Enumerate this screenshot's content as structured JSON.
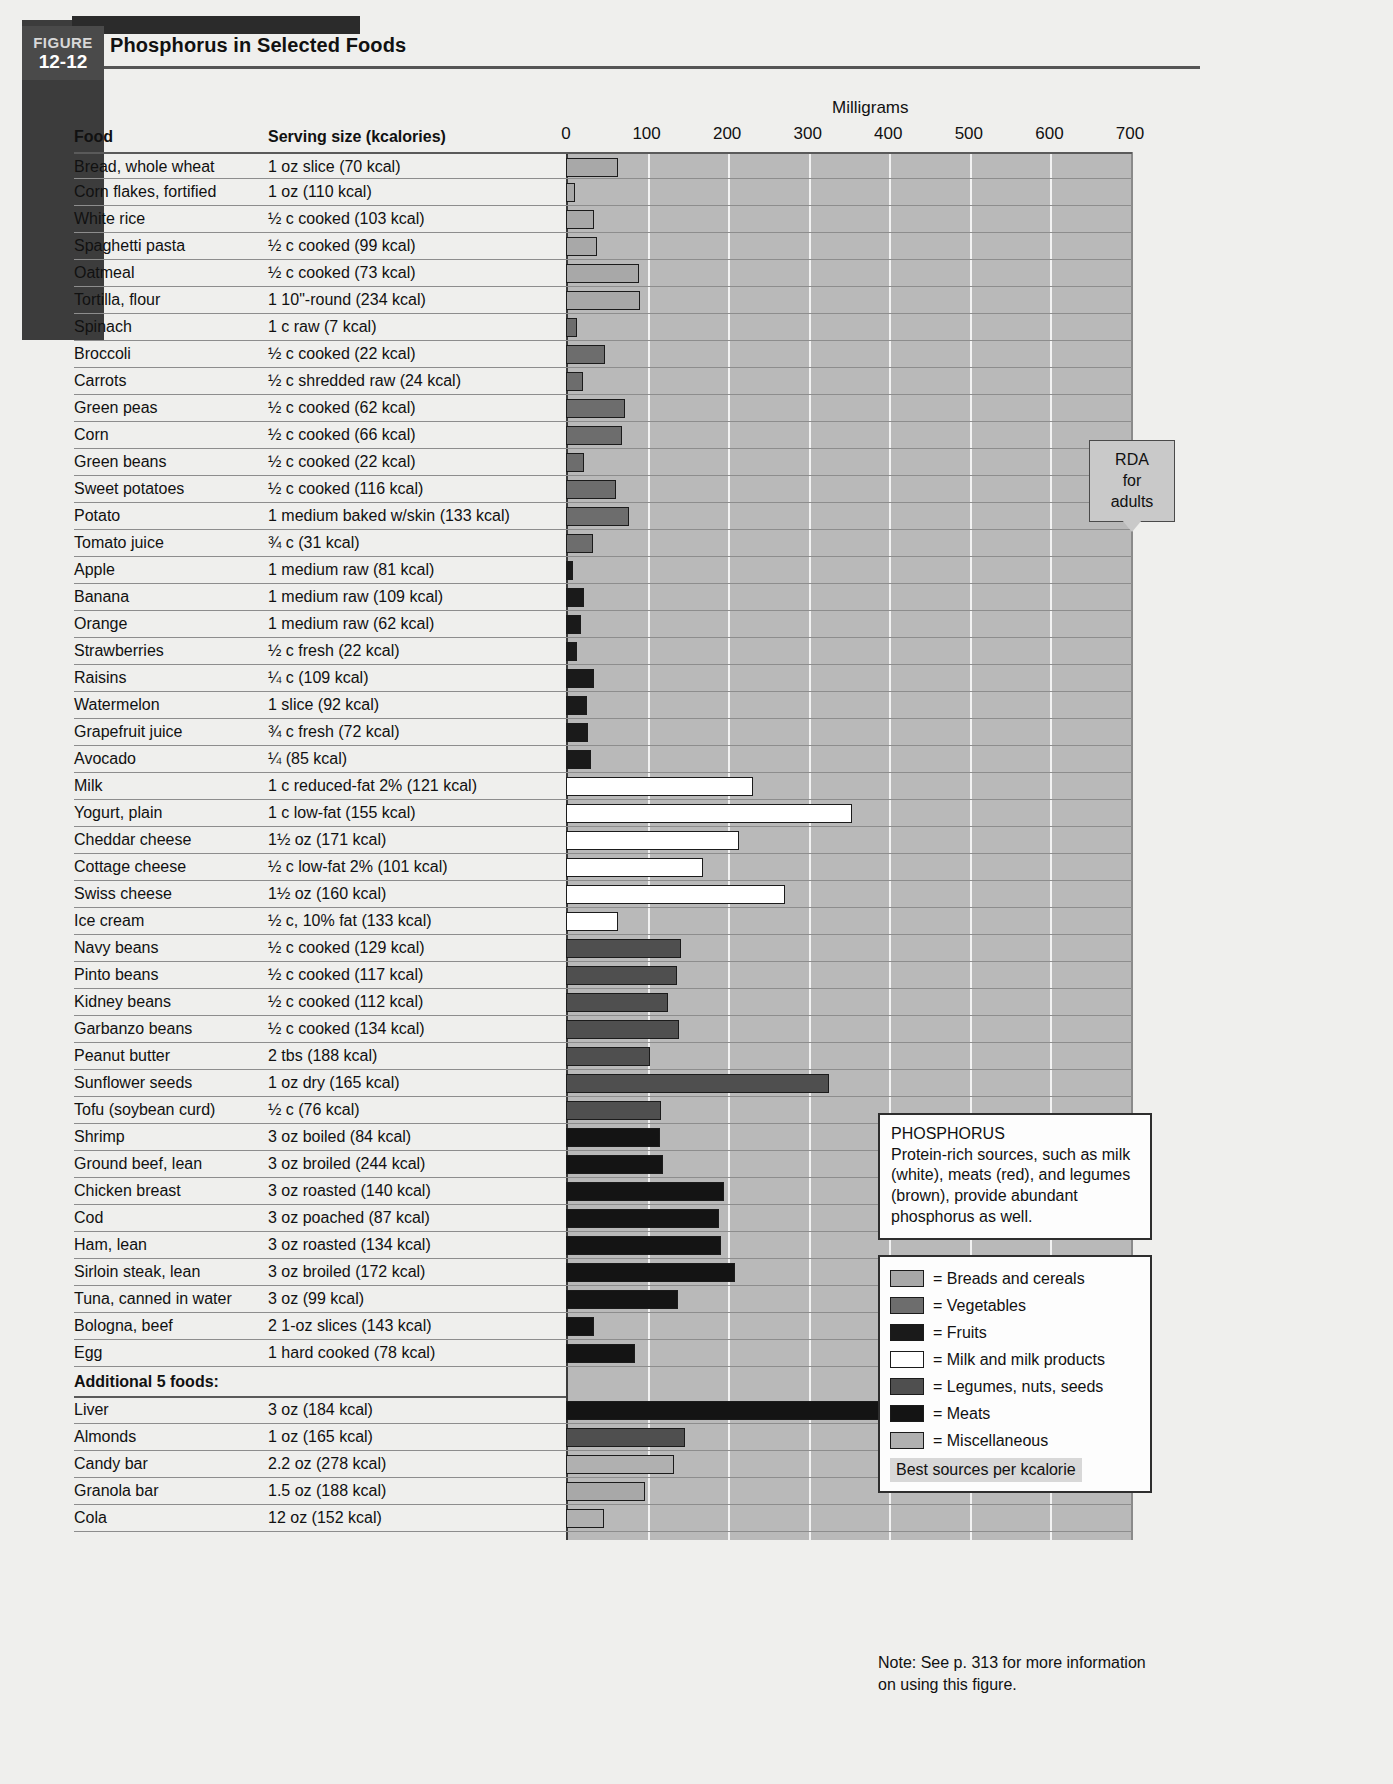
{
  "figure": {
    "tab_word": "FIGURE",
    "tab_number": "12-12",
    "title": "Phosphorus in Selected Foods"
  },
  "table_headers": {
    "food": "Food",
    "serving": "Serving size (kcalories)"
  },
  "rda_callout": {
    "line1": "RDA",
    "line2": "for",
    "line3": "adults",
    "value": 700
  },
  "info_callout": {
    "title": "PHOSPHORUS",
    "body": "Protein-rich sources, such as milk (white), meats (red), and legumes (brown), provide abundant phosphorus as well."
  },
  "legend": {
    "items": [
      {
        "label": "= Breads and cereals",
        "color": "#a8a8a8",
        "key": "breads"
      },
      {
        "label": "= Vegetables",
        "color": "#6d6d6d",
        "key": "vegetables"
      },
      {
        "label": "= Fruits",
        "color": "#1a1a1a",
        "key": "fruits"
      },
      {
        "label": "= Milk and milk products",
        "color": "#ffffff",
        "key": "milk"
      },
      {
        "label": "= Legumes, nuts, seeds",
        "color": "#4f4f4f",
        "key": "legumes"
      },
      {
        "label": "= Meats",
        "color": "#141414",
        "key": "meats"
      },
      {
        "label": "= Miscellaneous",
        "color": "#b0b0b0",
        "key": "misc"
      }
    ],
    "footer": "Best sources per kcalorie"
  },
  "note": "Note: See p. 313 for more information on using this figure.",
  "section_heading": "Additional 5 foods:",
  "chart_data": {
    "type": "bar",
    "title": "Phosphorus in Selected Foods",
    "xlabel": "Milligrams",
    "ylabel": "",
    "xlim": [
      0,
      700
    ],
    "xticks": [
      0,
      100,
      200,
      300,
      400,
      500,
      600,
      700
    ],
    "grid": true,
    "legend_position": "right",
    "reference_line": {
      "label": "RDA for adults",
      "value": 700
    },
    "units": "mg",
    "categories": [
      "Bread, whole wheat",
      "Corn flakes, fortified",
      "White rice",
      "Spaghetti pasta",
      "Oatmeal",
      "Tortilla, flour",
      "Spinach",
      "Broccoli",
      "Carrots",
      "Green peas",
      "Corn",
      "Green beans",
      "Sweet potatoes",
      "Potato",
      "Tomato juice",
      "Apple",
      "Banana",
      "Orange",
      "Strawberries",
      "Raisins",
      "Watermelon",
      "Grapefruit juice",
      "Avocado",
      "Milk",
      "Yogurt, plain",
      "Cheddar cheese",
      "Cottage cheese",
      "Swiss cheese",
      "Ice cream",
      "Navy beans",
      "Pinto beans",
      "Kidney beans",
      "Garbanzo beans",
      "Peanut butter",
      "Sunflower seeds",
      "Tofu (soybean curd)",
      "Shrimp",
      "Ground beef, lean",
      "Chicken breast",
      "Cod",
      "Ham, lean",
      "Sirloin steak, lean",
      "Tuna, canned in water",
      "Bologna, beef",
      "Egg",
      "Liver",
      "Almonds",
      "Candy bar",
      "Granola bar",
      "Cola"
    ],
    "values": [
      65,
      11,
      35,
      38,
      90,
      92,
      14,
      48,
      21,
      73,
      70,
      22,
      62,
      78,
      34,
      9,
      22,
      18,
      14,
      35,
      26,
      27,
      31,
      232,
      355,
      215,
      170,
      272,
      65,
      143,
      138,
      127,
      140,
      104,
      326,
      118,
      117,
      120,
      196,
      190,
      192,
      210,
      139,
      35,
      86,
      523,
      148,
      134,
      98,
      47
    ],
    "rows": [
      {
        "food": "Bread, whole wheat",
        "serving": "1 oz slice (70 kcal)",
        "value": 65,
        "group": "breads"
      },
      {
        "food": "Corn flakes, fortified",
        "serving": "1 oz (110 kcal)",
        "value": 11,
        "group": "breads"
      },
      {
        "food": "White rice",
        "serving": "½ c cooked (103 kcal)",
        "value": 35,
        "group": "breads"
      },
      {
        "food": "Spaghetti pasta",
        "serving": "½ c cooked (99 kcal)",
        "value": 38,
        "group": "breads"
      },
      {
        "food": "Oatmeal",
        "serving": "½ c cooked (73 kcal)",
        "value": 90,
        "group": "breads"
      },
      {
        "food": "Tortilla, flour",
        "serving": "1 10\"-round (234 kcal)",
        "value": 92,
        "group": "breads"
      },
      {
        "food": "Spinach",
        "serving": "1 c raw (7 kcal)",
        "value": 14,
        "group": "vegetables"
      },
      {
        "food": "Broccoli",
        "serving": "½ c cooked (22 kcal)",
        "value": 48,
        "group": "vegetables"
      },
      {
        "food": "Carrots",
        "serving": "½ c shredded raw (24 kcal)",
        "value": 21,
        "group": "vegetables"
      },
      {
        "food": "Green peas",
        "serving": "½ c cooked (62 kcal)",
        "value": 73,
        "group": "vegetables"
      },
      {
        "food": "Corn",
        "serving": "½ c cooked (66 kcal)",
        "value": 70,
        "group": "vegetables"
      },
      {
        "food": "Green beans",
        "serving": "½ c cooked (22 kcal)",
        "value": 22,
        "group": "vegetables"
      },
      {
        "food": "Sweet potatoes",
        "serving": "½ c cooked (116 kcal)",
        "value": 62,
        "group": "vegetables"
      },
      {
        "food": "Potato",
        "serving": "1 medium baked w/skin (133 kcal)",
        "value": 78,
        "group": "vegetables"
      },
      {
        "food": "Tomato juice",
        "serving": "¾ c (31 kcal)",
        "value": 34,
        "group": "vegetables"
      },
      {
        "food": "Apple",
        "serving": "1 medium raw (81 kcal)",
        "value": 9,
        "group": "fruits"
      },
      {
        "food": "Banana",
        "serving": "1 medium raw (109 kcal)",
        "value": 22,
        "group": "fruits"
      },
      {
        "food": "Orange",
        "serving": "1 medium raw (62 kcal)",
        "value": 18,
        "group": "fruits"
      },
      {
        "food": "Strawberries",
        "serving": "½ c fresh (22 kcal)",
        "value": 14,
        "group": "fruits"
      },
      {
        "food": "Raisins",
        "serving": "¼ c (109 kcal)",
        "value": 35,
        "group": "fruits"
      },
      {
        "food": "Watermelon",
        "serving": "1 slice (92 kcal)",
        "value": 26,
        "group": "fruits"
      },
      {
        "food": "Grapefruit juice",
        "serving": "¾ c fresh (72 kcal)",
        "value": 27,
        "group": "fruits"
      },
      {
        "food": "Avocado",
        "serving": "¼ (85 kcal)",
        "value": 31,
        "group": "fruits"
      },
      {
        "food": "Milk",
        "serving": "1 c reduced-fat 2% (121 kcal)",
        "value": 232,
        "group": "milk"
      },
      {
        "food": "Yogurt, plain",
        "serving": "1 c low-fat (155 kcal)",
        "value": 355,
        "group": "milk"
      },
      {
        "food": "Cheddar cheese",
        "serving": "1½ oz (171 kcal)",
        "value": 215,
        "group": "milk"
      },
      {
        "food": "Cottage cheese",
        "serving": "½ c low-fat 2% (101 kcal)",
        "value": 170,
        "group": "milk"
      },
      {
        "food": "Swiss cheese",
        "serving": "1½ oz (160 kcal)",
        "value": 272,
        "group": "milk"
      },
      {
        "food": "Ice cream",
        "serving": "½ c, 10% fat (133 kcal)",
        "value": 65,
        "group": "milk"
      },
      {
        "food": "Navy beans",
        "serving": "½ c cooked (129 kcal)",
        "value": 143,
        "group": "legumes"
      },
      {
        "food": "Pinto beans",
        "serving": "½ c cooked (117 kcal)",
        "value": 138,
        "group": "legumes"
      },
      {
        "food": "Kidney beans",
        "serving": "½ c cooked (112 kcal)",
        "value": 127,
        "group": "legumes"
      },
      {
        "food": "Garbanzo beans",
        "serving": "½ c cooked (134 kcal)",
        "value": 140,
        "group": "legumes"
      },
      {
        "food": "Peanut butter",
        "serving": "2 tbs (188 kcal)",
        "value": 104,
        "group": "legumes"
      },
      {
        "food": "Sunflower seeds",
        "serving": "1 oz dry (165 kcal)",
        "value": 326,
        "group": "legumes"
      },
      {
        "food": "Tofu (soybean curd)",
        "serving": "½ c (76 kcal)",
        "value": 118,
        "group": "legumes"
      },
      {
        "food": "Shrimp",
        "serving": "3 oz boiled (84 kcal)",
        "value": 117,
        "group": "meats"
      },
      {
        "food": "Ground beef, lean",
        "serving": "3 oz broiled (244 kcal)",
        "value": 120,
        "group": "meats"
      },
      {
        "food": "Chicken breast",
        "serving": "3 oz roasted (140 kcal)",
        "value": 196,
        "group": "meats"
      },
      {
        "food": "Cod",
        "serving": "3 oz poached (87 kcal)",
        "value": 190,
        "group": "meats"
      },
      {
        "food": "Ham, lean",
        "serving": "3 oz roasted (134 kcal)",
        "value": 192,
        "group": "meats"
      },
      {
        "food": "Sirloin steak, lean",
        "serving": "3 oz broiled (172 kcal)",
        "value": 210,
        "group": "meats"
      },
      {
        "food": "Tuna, canned in water",
        "serving": "3 oz (99 kcal)",
        "value": 139,
        "group": "meats"
      },
      {
        "food": "Bologna, beef",
        "serving": "2 1-oz slices (143 kcal)",
        "value": 35,
        "group": "meats"
      },
      {
        "food": "Egg",
        "serving": "1 hard cooked (78 kcal)",
        "value": 86,
        "group": "meats"
      }
    ],
    "additional_rows": [
      {
        "food": "Liver",
        "serving": "3 oz (184 kcal)",
        "value": 523,
        "group": "meats"
      },
      {
        "food": "Almonds",
        "serving": "1 oz (165 kcal)",
        "value": 148,
        "group": "legumes"
      },
      {
        "food": "Candy bar",
        "serving": "2.2 oz (278 kcal)",
        "value": 134,
        "group": "misc"
      },
      {
        "food": "Granola bar",
        "serving": "1.5 oz (188 kcal)",
        "value": 98,
        "group": "breads"
      },
      {
        "food": "Cola",
        "serving": "12 oz (152 kcal)",
        "value": 47,
        "group": "misc"
      }
    ]
  }
}
